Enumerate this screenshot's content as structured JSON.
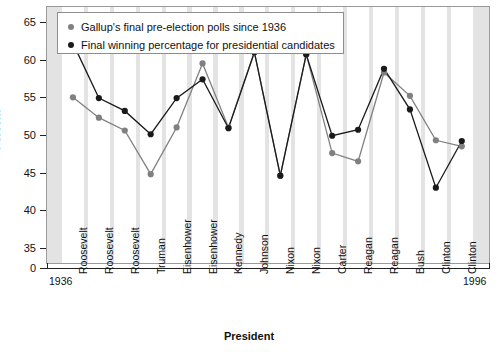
{
  "chart_data": {
    "type": "line",
    "title": "",
    "xlabel": "President",
    "ylabel": "Percent",
    "ylim": [
      33,
      67
    ],
    "yticks": [
      35,
      40,
      45,
      50,
      55,
      60,
      65
    ],
    "zero_tick": "0",
    "grid": "alternating vertical bands",
    "legend_position": "top-left inside plot",
    "x_start_label": "1936",
    "x_end_label": "1996",
    "categories": [
      "Roosevelt",
      "Roosevelt",
      "Roosevelt",
      "Truman",
      "Eisenhower",
      "Eisenhower",
      "Kennedy",
      "Johnson",
      "Nixon",
      "Nixon",
      "Carter",
      "Reagan",
      "Reagan",
      "Bush",
      "Clinton",
      "Clinton"
    ],
    "series": [
      {
        "name": "Gallup's final pre-election polls since 1936",
        "color": "#808080",
        "values": [
          55.0,
          52.3,
          50.6,
          44.8,
          51.0,
          59.5,
          51.0,
          61.0,
          44.6,
          60.7,
          47.6,
          46.5,
          58.3,
          55.2,
          49.3,
          48.5
        ]
      },
      {
        "name": "Final winning percentage for presidential candidates",
        "color": "#1a1a1a",
        "values": [
          62.2,
          54.9,
          53.2,
          50.1,
          54.9,
          57.4,
          50.9,
          61.0,
          44.6,
          60.7,
          49.9,
          50.7,
          58.8,
          53.4,
          43.0,
          49.2
        ]
      }
    ]
  },
  "legend": {
    "items": [
      {
        "label": "Gallup's final pre-election polls since 1936",
        "color": "#808080"
      },
      {
        "label": "Final winning percentage for presidential candidates",
        "color": "#1a1a1a"
      }
    ]
  },
  "axes": {
    "y_title": "Percent",
    "x_title": "President"
  }
}
